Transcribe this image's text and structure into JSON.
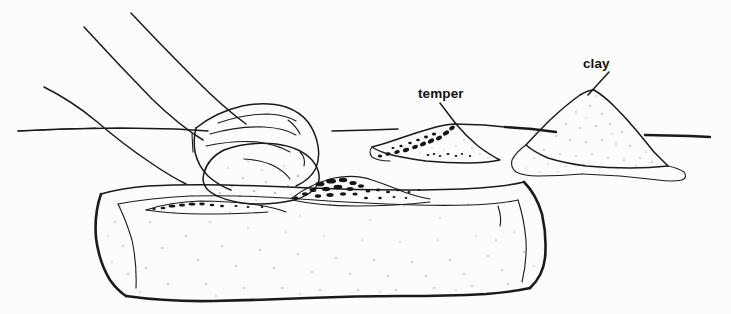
{
  "figure": {
    "background_color": "#fcfcfc",
    "ink_color": "#1a1a1a",
    "width": 731,
    "height": 314
  },
  "labels": [
    {
      "id": "temper",
      "text": "temper",
      "x": 418,
      "y": 98,
      "leader_from": [
        440,
        103
      ],
      "leader_to": [
        456,
        124
      ]
    },
    {
      "id": "clay",
      "text": "clay",
      "x": 583,
      "y": 68,
      "leader_from": [
        609,
        72
      ],
      "leader_to": [
        588,
        95
      ]
    }
  ],
  "scene_elements": [
    {
      "id": "arm",
      "name": "forearm",
      "note": "three contour lines sweeping from upper-left down to the fist"
    },
    {
      "id": "hand",
      "name": "hand-fist",
      "note": "closed hand with four finger contour lines pressing the clay ball"
    },
    {
      "id": "clay-ball",
      "name": "clay-ball",
      "note": "oval lump of clay beneath the hand on the slab"
    },
    {
      "id": "slab",
      "name": "stone-slab",
      "note": "rectangular stippled grinding stone with heavy outline"
    },
    {
      "id": "temper-on-slab",
      "name": "temper-grains-on-slab",
      "note": "dark granular temper scattered across the slab top surface"
    },
    {
      "id": "temper-pile",
      "name": "temper-pile",
      "note": "low mound of dark granular temper on the ground"
    },
    {
      "id": "clay-pile",
      "name": "clay-pile",
      "note": "conical stippled mound of clay on the ground"
    },
    {
      "id": "horizon",
      "name": "horizon-line",
      "note": "ground line running horizontally behind the scene"
    }
  ]
}
